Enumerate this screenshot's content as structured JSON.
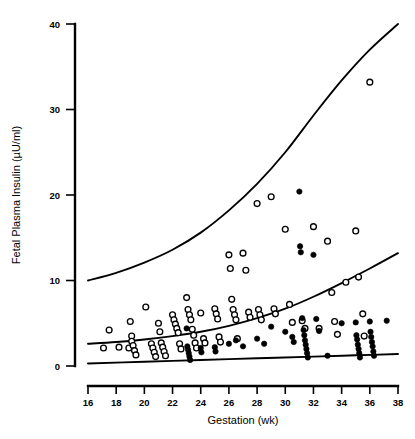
{
  "chart_data": {
    "type": "scatter",
    "title": "",
    "xlabel": "Gestation (wk)",
    "ylabel": "Fetal Plasma Insulin (µU/ml)",
    "xlim": [
      16,
      38
    ],
    "ylim": [
      0,
      40
    ],
    "xticks": [
      16,
      18,
      20,
      22,
      24,
      26,
      28,
      30,
      32,
      34,
      36,
      38
    ],
    "yticks": [
      0,
      10,
      20,
      30,
      40
    ],
    "xtick_labels": [
      "16",
      "18",
      "20",
      "22",
      "24",
      "26",
      "28",
      "30",
      "32",
      "34",
      "36",
      "38"
    ],
    "ytick_labels": [
      "0",
      "10",
      "20",
      "30",
      "40"
    ],
    "grid": false,
    "legend": "none",
    "series": [
      {
        "name": "Open circles",
        "marker": "open-circle",
        "color": "#000000",
        "points": [
          [
            17.1,
            2.1
          ],
          [
            17.5,
            4.2
          ],
          [
            18.2,
            2.2
          ],
          [
            18.9,
            2.1
          ],
          [
            19.0,
            5.2
          ],
          [
            19.1,
            3.5
          ],
          [
            19.1,
            2.9
          ],
          [
            19.2,
            2.4
          ],
          [
            19.3,
            1.8
          ],
          [
            19.4,
            1.3
          ],
          [
            20.1,
            6.9
          ],
          [
            20.5,
            2.6
          ],
          [
            20.6,
            2.1
          ],
          [
            20.7,
            1.6
          ],
          [
            20.8,
            1.1
          ],
          [
            21.0,
            5.0
          ],
          [
            21.1,
            4.0
          ],
          [
            21.2,
            2.7
          ],
          [
            21.3,
            2.2
          ],
          [
            21.4,
            1.7
          ],
          [
            21.5,
            1.2
          ],
          [
            22.0,
            6.0
          ],
          [
            22.1,
            5.4
          ],
          [
            22.2,
            4.9
          ],
          [
            22.3,
            4.4
          ],
          [
            22.4,
            3.9
          ],
          [
            22.5,
            2.6
          ],
          [
            22.6,
            2.0
          ],
          [
            23.0,
            8.0
          ],
          [
            23.1,
            6.6
          ],
          [
            23.2,
            6.0
          ],
          [
            23.3,
            5.4
          ],
          [
            23.4,
            4.3
          ],
          [
            23.5,
            3.6
          ],
          [
            23.6,
            2.7
          ],
          [
            23.7,
            2.1
          ],
          [
            24.0,
            6.2
          ],
          [
            24.2,
            3.2
          ],
          [
            24.3,
            2.7
          ],
          [
            25.0,
            6.7
          ],
          [
            25.1,
            6.1
          ],
          [
            25.2,
            5.5
          ],
          [
            25.3,
            3.4
          ],
          [
            25.4,
            2.8
          ],
          [
            26.0,
            13.0
          ],
          [
            26.1,
            11.4
          ],
          [
            26.2,
            7.8
          ],
          [
            26.3,
            6.6
          ],
          [
            26.4,
            6.0
          ],
          [
            26.5,
            5.4
          ],
          [
            26.6,
            3.2
          ],
          [
            27.0,
            13.2
          ],
          [
            27.2,
            11.2
          ],
          [
            27.4,
            6.3
          ],
          [
            27.5,
            5.7
          ],
          [
            28.0,
            19.0
          ],
          [
            28.1,
            6.6
          ],
          [
            28.2,
            6.0
          ],
          [
            28.3,
            5.4
          ],
          [
            29.0,
            19.8
          ],
          [
            29.2,
            6.7
          ],
          [
            29.3,
            6.1
          ],
          [
            30.0,
            16.0
          ],
          [
            30.3,
            7.2
          ],
          [
            30.5,
            5.1
          ],
          [
            31.2,
            5.3
          ],
          [
            31.4,
            4.4
          ],
          [
            32.0,
            16.3
          ],
          [
            32.4,
            4.4
          ],
          [
            33.0,
            14.6
          ],
          [
            33.3,
            8.6
          ],
          [
            33.5,
            5.2
          ],
          [
            33.7,
            3.7
          ],
          [
            34.3,
            9.8
          ],
          [
            35.0,
            15.8
          ],
          [
            35.2,
            10.4
          ],
          [
            35.5,
            6.1
          ],
          [
            35.6,
            3.5
          ],
          [
            36.0,
            33.2
          ]
        ]
      },
      {
        "name": "Filled circles",
        "marker": "filled-circle",
        "color": "#000000",
        "points": [
          [
            23.0,
            4.4
          ],
          [
            23.05,
            2.3
          ],
          [
            23.1,
            1.9
          ],
          [
            23.15,
            1.5
          ],
          [
            23.2,
            1.1
          ],
          [
            23.25,
            0.7
          ],
          [
            24.0,
            2.1
          ],
          [
            24.05,
            1.6
          ],
          [
            25.0,
            2.2
          ],
          [
            25.05,
            1.7
          ],
          [
            26.0,
            2.6
          ],
          [
            26.5,
            3.0
          ],
          [
            27.0,
            2.3
          ],
          [
            28.0,
            3.2
          ],
          [
            28.5,
            2.6
          ],
          [
            29.0,
            4.6
          ],
          [
            30.0,
            4.0
          ],
          [
            30.5,
            3.4
          ],
          [
            30.6,
            2.8
          ],
          [
            31.0,
            20.4
          ],
          [
            31.05,
            14.0
          ],
          [
            31.1,
            13.3
          ],
          [
            31.2,
            5.6
          ],
          [
            31.3,
            4.2
          ],
          [
            31.35,
            3.6
          ],
          [
            31.4,
            3.0
          ],
          [
            31.45,
            2.5
          ],
          [
            31.5,
            2.0
          ],
          [
            31.55,
            1.5
          ],
          [
            31.6,
            1.0
          ],
          [
            32.0,
            13.0
          ],
          [
            32.2,
            5.5
          ],
          [
            32.4,
            4.1
          ],
          [
            33.0,
            1.2
          ],
          [
            34.0,
            5.0
          ],
          [
            35.0,
            5.1
          ],
          [
            35.05,
            3.6
          ],
          [
            35.1,
            3.1
          ],
          [
            35.15,
            2.5
          ],
          [
            35.2,
            2.0
          ],
          [
            35.25,
            1.5
          ],
          [
            35.3,
            1.0
          ],
          [
            36.0,
            5.2
          ],
          [
            36.05,
            4.0
          ],
          [
            36.1,
            3.4
          ],
          [
            36.15,
            2.8
          ],
          [
            36.2,
            2.3
          ],
          [
            36.25,
            1.7
          ],
          [
            36.3,
            1.2
          ],
          [
            37.2,
            5.3
          ]
        ]
      }
    ],
    "curves": [
      {
        "name": "upper-reference-curve",
        "style": "solid",
        "points": [
          [
            16,
            10.0
          ],
          [
            18,
            10.9
          ],
          [
            20,
            12.1
          ],
          [
            22,
            13.6
          ],
          [
            24,
            15.6
          ],
          [
            26,
            18.2
          ],
          [
            28,
            21.3
          ],
          [
            30,
            25.0
          ],
          [
            32,
            29.3
          ],
          [
            34,
            33.4
          ],
          [
            36,
            37.0
          ],
          [
            38,
            40.0
          ]
        ]
      },
      {
        "name": "middle-reference-curve",
        "style": "solid",
        "points": [
          [
            16,
            2.6
          ],
          [
            18,
            2.8
          ],
          [
            20,
            3.1
          ],
          [
            22,
            3.5
          ],
          [
            24,
            4.0
          ],
          [
            26,
            4.7
          ],
          [
            28,
            5.6
          ],
          [
            30,
            6.7
          ],
          [
            32,
            8.1
          ],
          [
            34,
            9.7
          ],
          [
            36,
            11.4
          ],
          [
            38,
            13.2
          ]
        ]
      },
      {
        "name": "lower-reference-curve",
        "style": "solid",
        "points": [
          [
            16,
            0.3
          ],
          [
            20,
            0.5
          ],
          [
            24,
            0.7
          ],
          [
            28,
            0.9
          ],
          [
            32,
            1.1
          ],
          [
            35,
            1.25
          ],
          [
            38,
            1.4
          ]
        ]
      }
    ]
  },
  "axes": {
    "y_title": "Fetal  Plasma  Insulin  (µU/ml)",
    "x_title": "Gestation  (wk)"
  }
}
